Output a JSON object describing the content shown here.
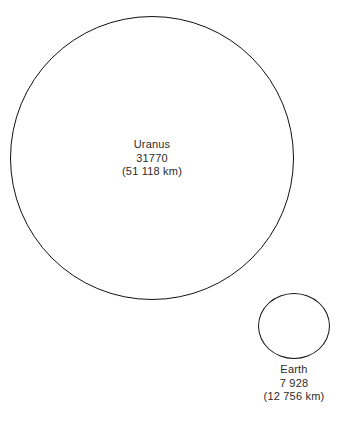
{
  "figure": {
    "type": "scale-comparison-diagram",
    "background_color": "#ffffff",
    "stroke_color": "#111111",
    "text_color": "#2b2b2b",
    "caption_fragment": ""
  },
  "bodies": [
    {
      "name": "Uranus",
      "diameter_miles": "31770",
      "diameter_km": "(51 118 km)"
    },
    {
      "name": "Earth",
      "diameter_miles": "7 928",
      "diameter_km": "(12 756 km)"
    }
  ],
  "chart_data": {
    "type": "scatter",
    "title": "",
    "subtitle": "",
    "xlabel": "",
    "ylabel": "",
    "grid": false,
    "legend": "none",
    "note": "Two unfilled circles drawn to relative scale comparing planetary diameters; each circle is annotated with the body name, diameter in miles, and diameter in kilometres.",
    "units": {
      "primary": "miles",
      "secondary": "km"
    },
    "categories": [
      "Uranus",
      "Earth"
    ],
    "values": [
      31770,
      7928
    ],
    "series": [
      {
        "name": "diameter_miles",
        "values": [
          31770,
          7928
        ]
      },
      {
        "name": "diameter_km",
        "values": [
          51118,
          12756
        ]
      },
      {
        "name": "rendered_circle_diameter_px",
        "values": [
          284,
          72
        ]
      }
    ],
    "annotations": [
      {
        "target": "Uranus",
        "lines": [
          "Uranus",
          "31770",
          "(51 118 km)"
        ],
        "position": "inside-circle-center"
      },
      {
        "target": "Earth",
        "lines": [
          "Earth",
          "7 928",
          "(12 756 km)"
        ],
        "position": "below-circle"
      }
    ]
  }
}
